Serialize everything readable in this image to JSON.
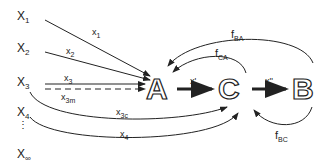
{
  "inputs": [
    {
      "base": "X",
      "sub": "1"
    },
    {
      "base": "X",
      "sub": "2"
    },
    {
      "base": "X",
      "sub": "3"
    },
    {
      "base": "X",
      "sub": "4"
    },
    {
      "base": "X",
      "sub": "∞"
    }
  ],
  "ellipsis": "⋮",
  "nodes": {
    "A": "A",
    "C": "C",
    "B": "B"
  },
  "edges": {
    "x1": {
      "base": "x",
      "sub": "1"
    },
    "x2": {
      "base": "x",
      "sub": "2"
    },
    "x3": {
      "base": "x",
      "sub": "3"
    },
    "x3m": {
      "base": "x",
      "sub": "3m"
    },
    "x3c": {
      "base": "x",
      "sub": "3c"
    },
    "x4": {
      "base": "x",
      "sub": "4"
    },
    "xprime": "x'",
    "xdprime": "x''",
    "fBA": {
      "base": "f",
      "sub": "BA"
    },
    "fCA": {
      "base": "f",
      "sub": "CA"
    },
    "fBC": {
      "base": "f",
      "sub": "BC"
    }
  }
}
